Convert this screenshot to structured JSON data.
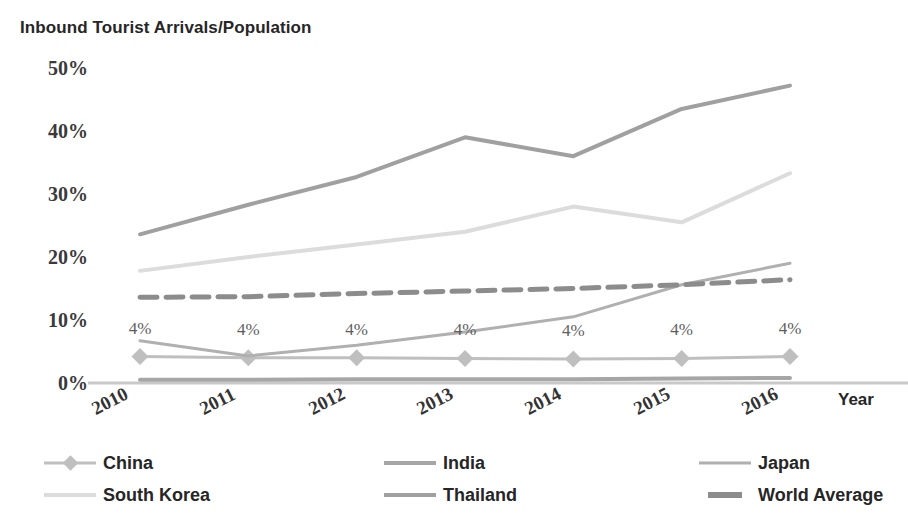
{
  "chart_data": {
    "type": "line",
    "title": "Inbound Tourist Arrivals/Population",
    "xlabel": "Year",
    "ylabel": "",
    "categories": [
      "2010",
      "2011",
      "2012",
      "2013",
      "2014",
      "2015",
      "2016"
    ],
    "x": [
      2010,
      2011,
      2012,
      2013,
      2014,
      2015,
      2016
    ],
    "ylim": [
      0,
      50
    ],
    "yticks": [
      0,
      10,
      20,
      30,
      40,
      50
    ],
    "ytick_labels": [
      "0%",
      "10%",
      "20%",
      "30%",
      "40%",
      "50%"
    ],
    "grid": false,
    "legend_position": "bottom",
    "value_suffix": "%",
    "series": [
      {
        "name": "China",
        "color": "#bfbfbf",
        "marker": "diamond",
        "dashed": false,
        "width": 3,
        "labeled": true,
        "values": [
          4.2,
          4.0,
          4.0,
          3.9,
          3.8,
          3.9,
          4.2
        ],
        "labels": [
          "4%",
          "4%",
          "4%",
          "4%",
          "4%",
          "4%",
          "4%"
        ]
      },
      {
        "name": "India",
        "color": "#a6a6a6",
        "marker": "none",
        "dashed": false,
        "width": 4,
        "labeled": false,
        "values": [
          0.5,
          0.5,
          0.6,
          0.6,
          0.6,
          0.7,
          0.8
        ]
      },
      {
        "name": "Japan",
        "color": "#b0b0b0",
        "marker": "none",
        "dashed": false,
        "width": 3,
        "labeled": false,
        "values": [
          6.7,
          4.3,
          6.0,
          8.1,
          10.5,
          15.6,
          19.0
        ]
      },
      {
        "name": "South Korea",
        "color": "#dcdcdc",
        "marker": "none",
        "dashed": false,
        "width": 4,
        "labeled": false,
        "values": [
          17.8,
          20.0,
          22.0,
          24.0,
          28.0,
          25.5,
          33.3
        ]
      },
      {
        "name": "Thailand",
        "color": "#a0a0a0",
        "marker": "none",
        "dashed": false,
        "width": 4,
        "labeled": false,
        "values": [
          23.6,
          28.3,
          32.7,
          39.0,
          36.0,
          43.5,
          47.2
        ]
      },
      {
        "name": "World Average",
        "color": "#8c8c8c",
        "marker": "none",
        "dashed": true,
        "width": 5,
        "labeled": false,
        "values": [
          13.6,
          13.7,
          14.2,
          14.6,
          15.0,
          15.6,
          16.4
        ]
      }
    ]
  },
  "legend": {
    "items": [
      {
        "label": "China"
      },
      {
        "label": "India"
      },
      {
        "label": "Japan"
      },
      {
        "label": "South Korea"
      },
      {
        "label": "Thailand"
      },
      {
        "label": "World Average"
      }
    ]
  },
  "colors": {
    "background": "#ffffff",
    "text": "#262626",
    "tick_text": "#3a3a3a",
    "data_label": "#5e5e5e"
  }
}
